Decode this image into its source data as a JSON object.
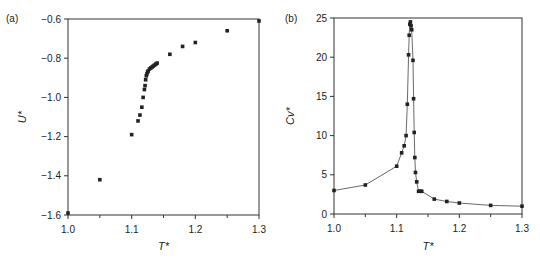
{
  "figure": {
    "panels": [
      "(a)",
      "(b)"
    ]
  },
  "chart_data": [
    {
      "type": "scatter",
      "panel_label": "(a)",
      "title": "",
      "xlabel": "T*",
      "ylabel": "U*",
      "xlim": [
        1.0,
        1.3
      ],
      "ylim": [
        -1.6,
        -0.6
      ],
      "xticks": [
        1.0,
        1.1,
        1.2,
        1.3
      ],
      "xtick_labels": [
        "1.0",
        "1.1",
        "1.2",
        "1.3"
      ],
      "yticks": [
        -0.6,
        -0.8,
        -1.0,
        -1.2,
        -1.4,
        -1.6
      ],
      "ytick_labels": [
        "-0.6",
        "-0.8",
        "-1.0",
        "-1.2",
        "-1.4",
        "-1.6"
      ],
      "grid": false,
      "legend": null,
      "series": [
        {
          "name": "U*",
          "marker": "square",
          "line": false,
          "x": [
            1.0,
            1.05,
            1.1,
            1.11,
            1.113,
            1.116,
            1.118,
            1.12,
            1.121,
            1.122,
            1.123,
            1.124,
            1.125,
            1.126,
            1.128,
            1.13,
            1.132,
            1.134,
            1.136,
            1.138,
            1.14,
            1.16,
            1.18,
            1.2,
            1.25,
            1.3
          ],
          "y": [
            -1.59,
            -1.42,
            -1.19,
            -1.12,
            -1.09,
            -1.05,
            -1.0,
            -0.96,
            -0.94,
            -0.91,
            -0.89,
            -0.88,
            -0.87,
            -0.865,
            -0.855,
            -0.85,
            -0.845,
            -0.84,
            -0.835,
            -0.83,
            -0.825,
            -0.78,
            -0.74,
            -0.72,
            -0.66,
            -0.61
          ]
        }
      ]
    },
    {
      "type": "line",
      "panel_label": "(b)",
      "title": "",
      "xlabel": "T*",
      "ylabel": "Cv*",
      "xlim": [
        1.0,
        1.3
      ],
      "ylim": [
        0,
        25
      ],
      "xticks": [
        1.0,
        1.1,
        1.2,
        1.3
      ],
      "xtick_labels": [
        "1.0",
        "1.1",
        "1.2",
        "1.3"
      ],
      "yticks": [
        0,
        5,
        10,
        15,
        20,
        25
      ],
      "ytick_labels": [
        "0",
        "5",
        "10",
        "15",
        "20",
        "25"
      ],
      "grid": false,
      "legend": null,
      "series": [
        {
          "name": "Cv*",
          "marker": "square",
          "line": true,
          "x": [
            1.0,
            1.05,
            1.1,
            1.108,
            1.112,
            1.115,
            1.117,
            1.119,
            1.12,
            1.121,
            1.122,
            1.123,
            1.124,
            1.126,
            1.127,
            1.128,
            1.129,
            1.13,
            1.132,
            1.135,
            1.138,
            1.14,
            1.16,
            1.18,
            1.2,
            1.25,
            1.3
          ],
          "y": [
            3.0,
            3.7,
            6.1,
            7.8,
            8.7,
            10.0,
            14.0,
            20.3,
            22.8,
            24.2,
            24.5,
            24.0,
            23.5,
            19.6,
            14.7,
            10.4,
            7.2,
            5.3,
            4.1,
            2.9,
            2.9,
            2.9,
            1.9,
            1.6,
            1.4,
            1.1,
            1.0
          ]
        }
      ]
    }
  ]
}
